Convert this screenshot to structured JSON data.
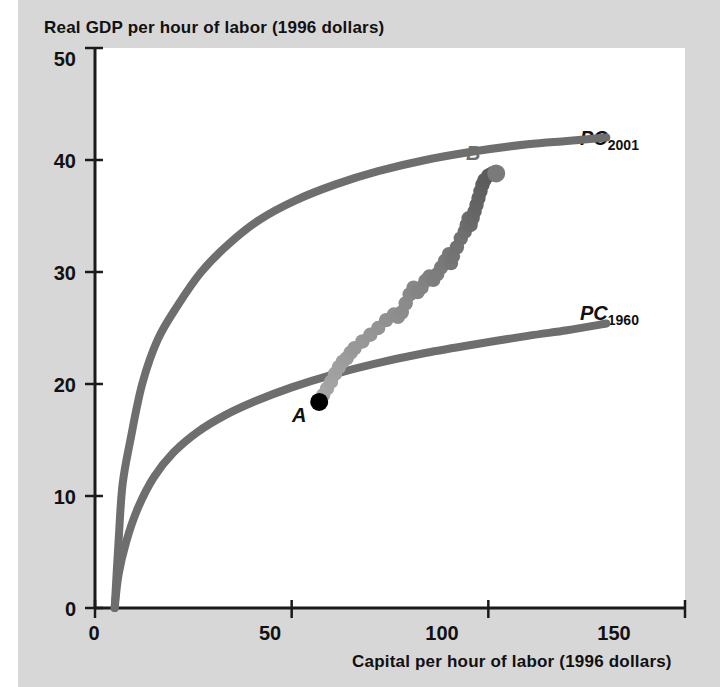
{
  "figure": {
    "background_color": "#d7d7d7",
    "plot_background_color": "#ffffff",
    "curve_color": "#6e6e6e",
    "axis_color": "#1a1a1a",
    "point_a_color": "#000000",
    "point_b_color": "#7a7a7a"
  },
  "chart_data": {
    "type": "scatter",
    "title": "",
    "ylabel": "Real GDP per hour of labor (1996 dollars)",
    "xlabel": "Capital per hour of labor (1996 dollars)",
    "xlim": [
      0,
      150
    ],
    "ylim": [
      0,
      50
    ],
    "xticks": [
      0,
      50,
      100,
      150
    ],
    "yticks": [
      0,
      10,
      20,
      30,
      40,
      50
    ],
    "grid": false,
    "legend": "inline-curve-labels",
    "series": [
      {
        "name": "PC2001",
        "label_main": "PC",
        "label_sub": "2001",
        "type": "line",
        "color": "#6e6e6e",
        "points": [
          [
            5,
            0
          ],
          [
            6,
            6
          ],
          [
            7,
            11
          ],
          [
            9,
            15
          ],
          [
            12,
            20
          ],
          [
            16,
            24
          ],
          [
            21,
            27
          ],
          [
            27,
            30
          ],
          [
            34,
            32.5
          ],
          [
            42,
            34.7
          ],
          [
            51,
            36.4
          ],
          [
            61,
            37.8
          ],
          [
            72,
            39.0
          ],
          [
            84,
            40.0
          ],
          [
            97,
            40.8
          ],
          [
            110,
            41.4
          ],
          [
            120,
            41.7
          ],
          [
            130,
            42.0
          ]
        ]
      },
      {
        "name": "PC1960",
        "label_main": "PC",
        "label_sub": "1960",
        "type": "line",
        "color": "#6e6e6e",
        "points": [
          [
            5,
            0
          ],
          [
            6,
            3
          ],
          [
            8,
            6
          ],
          [
            11,
            9
          ],
          [
            15,
            11.7
          ],
          [
            20,
            13.9
          ],
          [
            26,
            15.7
          ],
          [
            33,
            17.2
          ],
          [
            41,
            18.5
          ],
          [
            50,
            19.7
          ],
          [
            60,
            20.8
          ],
          [
            71,
            21.8
          ],
          [
            83,
            22.7
          ],
          [
            96,
            23.5
          ],
          [
            110,
            24.3
          ],
          [
            120,
            24.8
          ],
          [
            130,
            25.4
          ]
        ]
      },
      {
        "name": "Actual path 1960-2001",
        "type": "scatter",
        "color_start": "#a8a8a8",
        "color_end": "#5a5a5a",
        "points": [
          [
            57,
            18.4
          ],
          [
            58,
            19.0
          ],
          [
            59,
            19.6
          ],
          [
            60,
            20.2
          ],
          [
            61,
            20.9
          ],
          [
            62,
            21.5
          ],
          [
            63,
            22.0
          ],
          [
            64,
            22.3
          ],
          [
            65,
            22.8
          ],
          [
            66,
            23.2
          ],
          [
            68,
            23.8
          ],
          [
            70,
            24.4
          ],
          [
            72,
            25.0
          ],
          [
            74,
            25.7
          ],
          [
            76,
            26.2
          ],
          [
            77,
            26.0
          ],
          [
            78,
            26.4
          ],
          [
            79,
            27.2
          ],
          [
            80,
            28.0
          ],
          [
            81,
            28.6
          ],
          [
            82,
            28.2
          ],
          [
            83,
            28.6
          ],
          [
            84,
            29.2
          ],
          [
            85,
            29.6
          ],
          [
            86,
            29.3
          ],
          [
            87,
            29.8
          ],
          [
            88,
            30.4
          ],
          [
            89,
            31.0
          ],
          [
            90,
            31.6
          ],
          [
            90.5,
            30.8
          ],
          [
            91,
            31.4
          ],
          [
            92,
            32.2
          ],
          [
            93,
            33.0
          ],
          [
            94,
            33.6
          ],
          [
            94.5,
            34.2
          ],
          [
            95,
            34.8
          ],
          [
            95.5,
            34.2
          ],
          [
            96,
            34.8
          ],
          [
            96.5,
            35.4
          ],
          [
            97,
            36.0
          ],
          [
            97.5,
            36.6
          ],
          [
            98,
            37.2
          ],
          [
            98.5,
            37.8
          ],
          [
            99,
            38.2
          ],
          [
            100,
            38.6
          ],
          [
            101,
            38.8
          ]
        ]
      }
    ],
    "annotations": [
      {
        "name": "point-a",
        "label": "A",
        "x": 57,
        "y": 18.4,
        "color": "#000000",
        "label_position": "below"
      },
      {
        "name": "point-b",
        "label": "B",
        "x": 102,
        "y": 38.8,
        "color": "#7a7a7a",
        "label_position": "above"
      }
    ]
  },
  "axis": {
    "ytick_labels": [
      "50",
      "40",
      "30",
      "20",
      "10",
      "0"
    ],
    "xtick_labels": [
      "0",
      "50",
      "100",
      "150"
    ]
  },
  "labels": {
    "pc2001_main": "PC",
    "pc2001_sub": "2001",
    "pc1960_main": "PC",
    "pc1960_sub": "1960",
    "point_a": "A",
    "point_b": "B"
  }
}
